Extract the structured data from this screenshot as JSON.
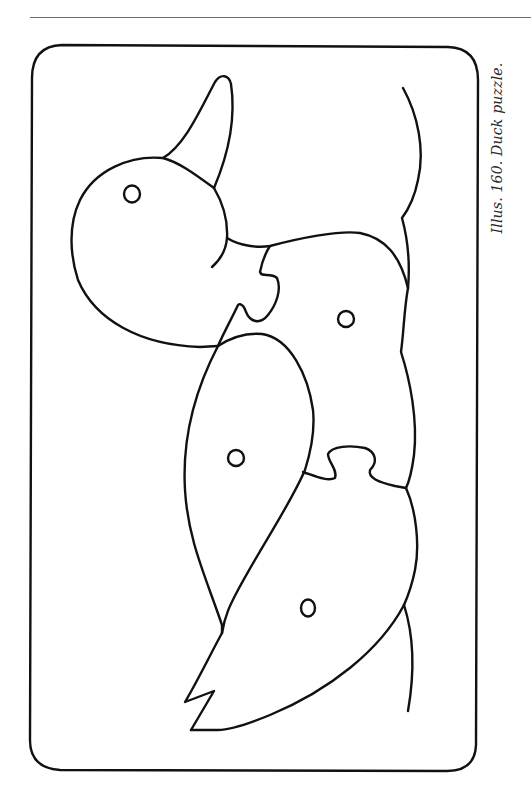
{
  "figure": {
    "caption": "Illus. 160. Duck puzzle.",
    "pieces": [
      {
        "name": "head-with-beak",
        "has_eye_hole": true
      },
      {
        "name": "neck-body-front",
        "has_eye_hole": true
      },
      {
        "name": "upper-wing",
        "has_eye_hole": true
      },
      {
        "name": "lower-wing-tail",
        "has_eye_hole": true
      }
    ],
    "colors": {
      "line": "#111111",
      "background": "#ffffff",
      "rule": "#6b6b6b"
    }
  }
}
